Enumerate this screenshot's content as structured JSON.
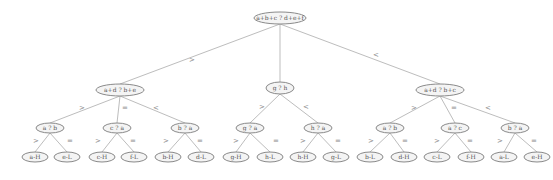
{
  "diagram": {
    "type": "decision-tree",
    "root": {
      "label": "a+b+c ? d+e+f",
      "x": 280,
      "y": 18,
      "rx": 26,
      "ry": 6
    },
    "level2": [
      {
        "id": "L",
        "label": "a+d ? b+e",
        "x": 120,
        "y": 90,
        "rx": 24,
        "ry": 6,
        "edge_label": ">",
        "lx": 192,
        "ly": 60
      },
      {
        "id": "M",
        "label": "g ? h",
        "x": 280,
        "y": 88,
        "rx": 14,
        "ry": 6,
        "edge_label": "",
        "lx": 0,
        "ly": 0
      },
      {
        "id": "R",
        "label": "a+d ? b+c",
        "x": 440,
        "y": 90,
        "rx": 24,
        "ry": 6,
        "edge_label": "<",
        "lx": 376,
        "ly": 55
      }
    ],
    "level3": [
      {
        "parent": "L",
        "label": "a ? b",
        "x": 50,
        "y": 128,
        "rx": 14,
        "ry": 5,
        "edge_label": ">",
        "lx": 82,
        "ly": 108
      },
      {
        "parent": "L",
        "label": "c ? a",
        "x": 117,
        "y": 128,
        "rx": 14,
        "ry": 5,
        "edge_label": "=",
        "lx": 125,
        "ly": 108
      },
      {
        "parent": "L",
        "label": "b ? a",
        "x": 185,
        "y": 128,
        "rx": 14,
        "ry": 5,
        "edge_label": "<",
        "lx": 156,
        "ly": 108
      },
      {
        "parent": "M",
        "label": "g ? a",
        "x": 250,
        "y": 128,
        "rx": 14,
        "ry": 5,
        "edge_label": ">",
        "lx": 262,
        "ly": 107
      },
      {
        "parent": "M",
        "label": "h ? a",
        "x": 318,
        "y": 128,
        "rx": 14,
        "ry": 5,
        "edge_label": "<",
        "lx": 306,
        "ly": 107
      },
      {
        "parent": "R",
        "label": "a ? b",
        "x": 390,
        "y": 128,
        "rx": 14,
        "ry": 5,
        "edge_label": ">",
        "lx": 414,
        "ly": 108
      },
      {
        "parent": "R",
        "label": "a ? c",
        "x": 455,
        "y": 128,
        "rx": 14,
        "ry": 5,
        "edge_label": "=",
        "lx": 454,
        "ly": 108
      },
      {
        "parent": "R",
        "label": "b ? a",
        "x": 515,
        "y": 128,
        "rx": 14,
        "ry": 5,
        "edge_label": "<",
        "lx": 488,
        "ly": 108
      }
    ],
    "leaves": [
      {
        "parent": 0,
        "label": "a-H",
        "x": 35,
        "y": 157,
        "edge_label": ">",
        "lx": 36,
        "ly": 141
      },
      {
        "parent": 0,
        "label": "e-L",
        "x": 67,
        "y": 157,
        "edge_label": "=",
        "lx": 70,
        "ly": 141
      },
      {
        "parent": 1,
        "label": "c-H",
        "x": 102,
        "y": 157,
        "edge_label": ">",
        "lx": 98,
        "ly": 141
      },
      {
        "parent": 1,
        "label": "f-L",
        "x": 134,
        "y": 157,
        "edge_label": "=",
        "lx": 133,
        "ly": 141
      },
      {
        "parent": 2,
        "label": "b-H",
        "x": 168,
        "y": 157,
        "edge_label": ">",
        "lx": 166,
        "ly": 141
      },
      {
        "parent": 2,
        "label": "d-L",
        "x": 201,
        "y": 157,
        "edge_label": "=",
        "lx": 200,
        "ly": 141
      },
      {
        "parent": 3,
        "label": "g-H",
        "x": 236,
        "y": 157,
        "edge_label": ">",
        "lx": 236,
        "ly": 141
      },
      {
        "parent": 3,
        "label": "h-L",
        "x": 270,
        "y": 157,
        "edge_label": "=",
        "lx": 276,
        "ly": 141
      },
      {
        "parent": 4,
        "label": "h-H",
        "x": 303,
        "y": 157,
        "edge_label": ">",
        "lx": 303,
        "ly": 141
      },
      {
        "parent": 4,
        "label": "g-L",
        "x": 336,
        "y": 157,
        "edge_label": "=",
        "lx": 338,
        "ly": 141
      },
      {
        "parent": 5,
        "label": "b-L",
        "x": 370,
        "y": 157,
        "edge_label": ">",
        "lx": 371,
        "ly": 141
      },
      {
        "parent": 5,
        "label": "d-H",
        "x": 404,
        "y": 157,
        "edge_label": "=",
        "lx": 405,
        "ly": 141
      },
      {
        "parent": 6,
        "label": "c-L",
        "x": 437,
        "y": 157,
        "edge_label": ">",
        "lx": 437,
        "ly": 141
      },
      {
        "parent": 6,
        "label": "f-H",
        "x": 471,
        "y": 157,
        "edge_label": "=",
        "lx": 470,
        "ly": 141
      },
      {
        "parent": 7,
        "label": "a-L",
        "x": 504,
        "y": 157,
        "edge_label": ">",
        "lx": 500,
        "ly": 141
      },
      {
        "parent": 7,
        "label": "e-H",
        "x": 537,
        "y": 157,
        "edge_label": "=",
        "lx": 534,
        "ly": 141
      }
    ],
    "leaf_size": {
      "rx": 13,
      "ry": 5
    }
  }
}
